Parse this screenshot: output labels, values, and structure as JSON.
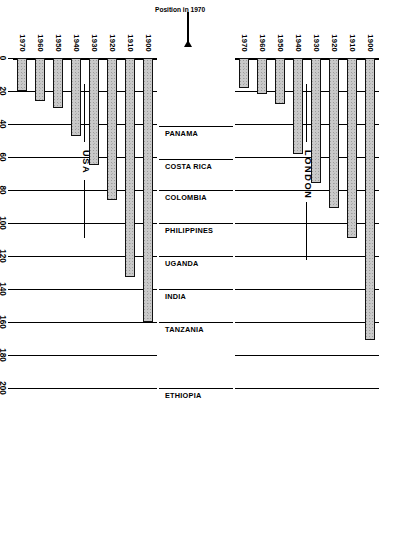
{
  "figure": {
    "caption_lines": [
      "Figure 1.7. Changes in infant mortality in London and the United States, 1900–1970, compared with selected",
      "nations in 1970. (Sources of data: Registrar General, ",
      "Statistical Abstract of the United States",
      ", and UN",
      "Demographic Yearbook.)"
    ],
    "caption_line1": "Figure 1.7. Changes in infant mortality in London and the United States, 1900–1970, compared with selected",
    "caption_line2_a": "nations in 1970. (Sources of data: Registrar General, ",
    "caption_line2_italic": "Statistical Abstract of the United States",
    "caption_line2_b": ", and UN",
    "caption_line3": "Demographic Yearbook.)"
  },
  "chart_data": {
    "type": "bar",
    "orientation": "horizontal",
    "xlabel": "Infant deaths per 1000 live births",
    "ylabel": "",
    "xlim": [
      0,
      200
    ],
    "xticks": [
      0,
      20,
      40,
      60,
      80,
      100,
      120,
      140,
      160,
      180,
      200
    ],
    "xticklabels": [
      "0",
      "20",
      "40",
      "60",
      "80",
      "100",
      "120",
      "140",
      "160",
      "180",
      "200"
    ],
    "grid": true,
    "legend": "none",
    "panels": [
      {
        "name": "LONDON",
        "categories": [
          "1900",
          "1910",
          "1920",
          "1930",
          "1940",
          "1950",
          "1960",
          "1970"
        ],
        "values": [
          171,
          109,
          91,
          76,
          58,
          28,
          22,
          18
        ]
      },
      {
        "name": "USA",
        "categories": [
          "1900",
          "1910",
          "1920",
          "1930",
          "1940",
          "1950",
          "1960",
          "1970"
        ],
        "values": [
          160,
          133,
          86,
          65,
          47,
          30,
          26,
          20
        ]
      }
    ],
    "reference_markers": {
      "label": "Position in 1970",
      "countries": [
        {
          "name": "ETHIOPIA",
          "value": 200
        },
        {
          "name": "TANZANIA",
          "value": 160
        },
        {
          "name": "INDIA",
          "value": 140
        },
        {
          "name": "UGANDA",
          "value": 120
        },
        {
          "name": "PHILIPPINES",
          "value": 100
        },
        {
          "name": "COLOMBIA",
          "value": 80
        },
        {
          "name": "COSTA RICA",
          "value": 61
        },
        {
          "name": "PANAMA",
          "value": 41
        }
      ]
    }
  },
  "axis": {
    "title": "Infant deaths per 1000 live births",
    "ticks": [
      "0",
      "20",
      "40",
      "60",
      "80",
      "100",
      "120",
      "140",
      "160",
      "180",
      "200"
    ]
  },
  "panels": {
    "london_label": "LONDON",
    "usa_label": "USA"
  },
  "position_marker": {
    "label": "Position in 1970"
  },
  "colors": {
    "bar_fill": "#c9c9c9",
    "bar_stroke": "#111111",
    "axis": "#000000",
    "paper": "#ffffff"
  }
}
